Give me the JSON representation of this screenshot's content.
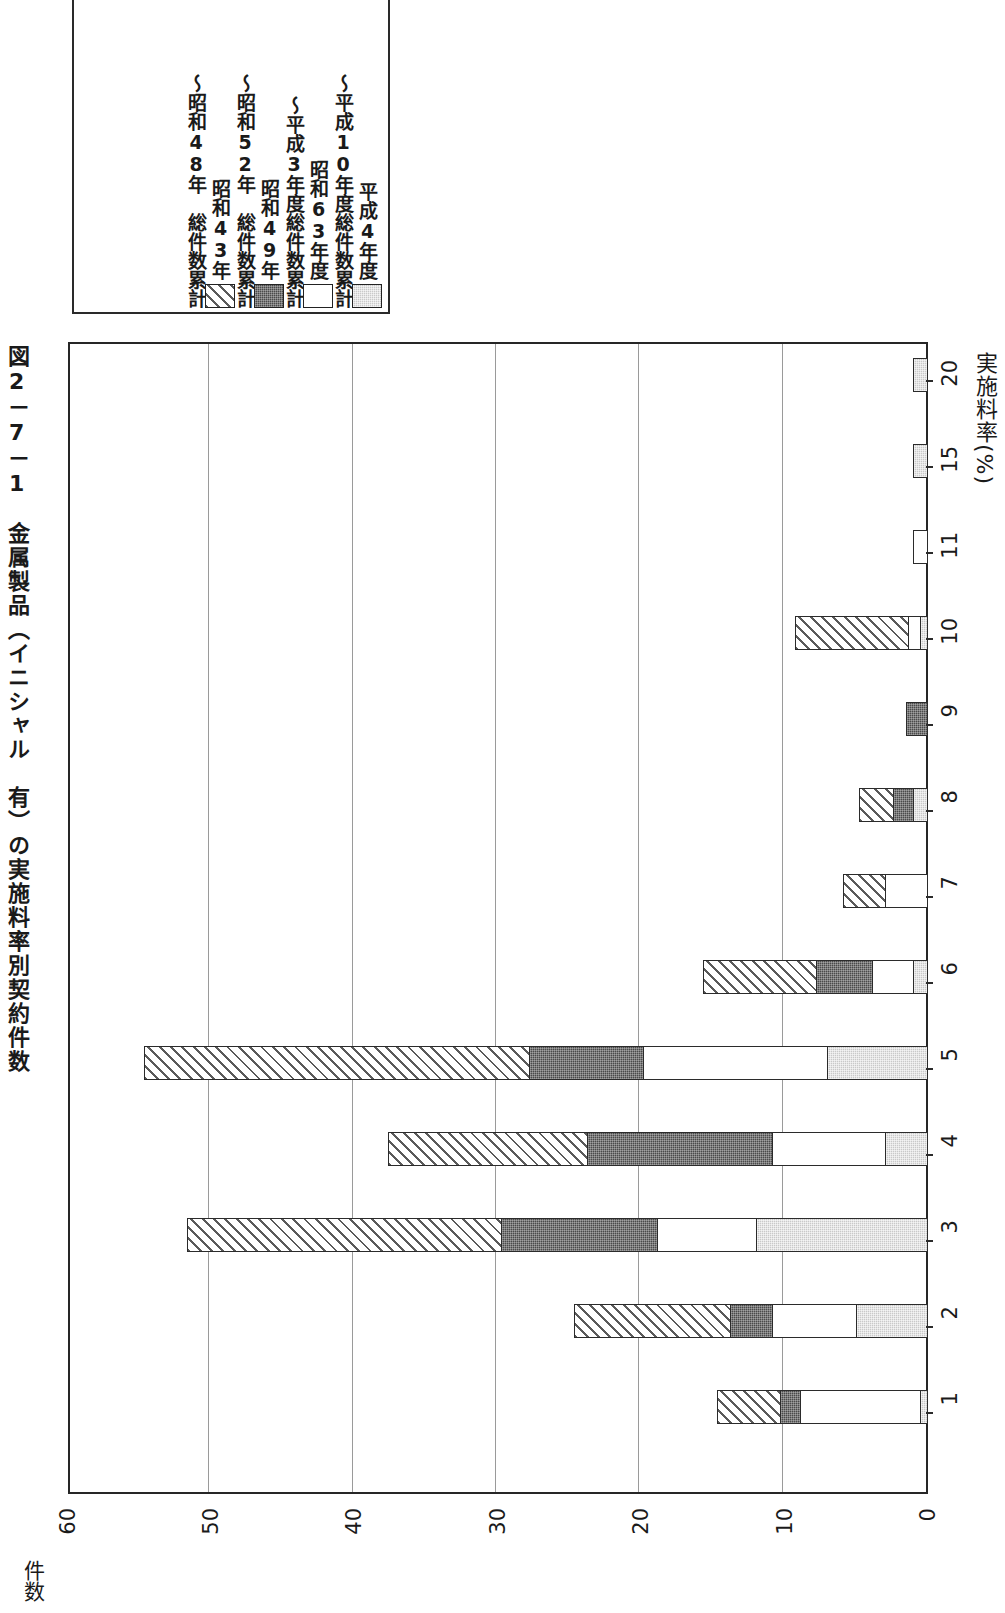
{
  "title": "図2－7－1　金属製品（イニシャル　有）の実施料率別契約件数",
  "legend": {
    "entries": [
      {
        "swatch": "light-gray-stipple",
        "color": "#c9c9c9",
        "label": "平成4年度",
        "cont": "～平成10年度総件数累計"
      },
      {
        "swatch": "white",
        "color": "#ffffff",
        "label": "昭和63年度",
        "cont": "～平成3年度総件数累計"
      },
      {
        "swatch": "dark-gray-stipple",
        "color": "#4a4a4a",
        "label": "昭和49年",
        "cont": "～昭和52年　総件数累計"
      },
      {
        "swatch": "diagonal-hatch",
        "color": "#5a5a5a",
        "label": "昭和43年",
        "cont": "～昭和48年　総件数累計"
      }
    ]
  },
  "axes": {
    "value_axis_title": "件数",
    "value_ticks": [
      "0",
      "10",
      "20",
      "30",
      "40",
      "50",
      "60"
    ],
    "category_axis_title_main": "実施料率",
    "category_axis_title_unit": "(%)"
  },
  "chart_data": {
    "type": "bar",
    "orientation": "horizontal-rotated",
    "title": "図2－7－1　金属製品（イニシャル　有）の実施料率別契約件数",
    "xlabel": "実施料率 (%)",
    "ylabel": "件数",
    "ylim": [
      0,
      60
    ],
    "grid": true,
    "stacked": true,
    "legend_position": "top-left",
    "categories": [
      "1",
      "2",
      "3",
      "4",
      "5",
      "6",
      "7",
      "8",
      "9",
      "10",
      "11",
      "15",
      "20"
    ],
    "series": [
      {
        "name": "昭和43年～昭和48年 総件数累計",
        "fill": "diagonal-hatch",
        "values": [
          4.5,
          11,
          22,
          14,
          27,
          8,
          3,
          2.5,
          0,
          8,
          0,
          0,
          0
        ]
      },
      {
        "name": "昭和49年～昭和52年 総件数累計",
        "fill": "dark-gray-stipple",
        "values": [
          1.5,
          3,
          11,
          13,
          8,
          4,
          0,
          1.5,
          1.5,
          0,
          0,
          0,
          0
        ]
      },
      {
        "name": "昭和63年度～平成3年度総件数累計",
        "fill": "white",
        "values": [
          8.5,
          6,
          7,
          8,
          13,
          3,
          3,
          0,
          0,
          1,
          1,
          0,
          0
        ]
      },
      {
        "name": "平成4年度～平成10年度総件数累計",
        "fill": "light-gray-stipple",
        "values": [
          0.5,
          5,
          12,
          3,
          7,
          1,
          0,
          1,
          0,
          0.5,
          0,
          1,
          1
        ]
      }
    ],
    "totals": [
      15,
      25,
      52,
      38,
      55,
      16,
      6,
      5,
      1.5,
      9.5,
      1,
      1,
      1
    ]
  },
  "render": {
    "plot_px": {
      "left": 68,
      "top": 342,
      "width": 860,
      "height": 1152
    },
    "value_max": 60,
    "category_tick_positions": [
      1410,
      1324,
      1238,
      1152,
      1066,
      980,
      894,
      808,
      722,
      636,
      550,
      464,
      378
    ],
    "bar_rows": [
      {
        "cat": "1",
        "top": 1388,
        "segs": [
          {
            "fill": "fill-gray",
            "len": 0.5
          },
          {
            "fill": "fill-white",
            "len": 8.5
          },
          {
            "fill": "fill-dark",
            "len": 1.5
          },
          {
            "fill": "fill-hatch",
            "len": 4.5
          }
        ]
      },
      {
        "cat": "2",
        "top": 1302,
        "segs": [
          {
            "fill": "fill-gray",
            "len": 5
          },
          {
            "fill": "fill-white",
            "len": 6
          },
          {
            "fill": "fill-dark",
            "len": 3
          },
          {
            "fill": "fill-hatch",
            "len": 11
          }
        ]
      },
      {
        "cat": "3",
        "top": 1216,
        "segs": [
          {
            "fill": "fill-gray",
            "len": 12
          },
          {
            "fill": "fill-white",
            "len": 7
          },
          {
            "fill": "fill-dark",
            "len": 11
          },
          {
            "fill": "fill-hatch",
            "len": 22
          }
        ]
      },
      {
        "cat": "4",
        "top": 1130,
        "segs": [
          {
            "fill": "fill-gray",
            "len": 3
          },
          {
            "fill": "fill-white",
            "len": 8
          },
          {
            "fill": "fill-dark",
            "len": 13
          },
          {
            "fill": "fill-hatch",
            "len": 14
          }
        ]
      },
      {
        "cat": "5",
        "top": 1044,
        "segs": [
          {
            "fill": "fill-gray",
            "len": 7
          },
          {
            "fill": "fill-white",
            "len": 13
          },
          {
            "fill": "fill-dark",
            "len": 8
          },
          {
            "fill": "fill-hatch",
            "len": 27
          }
        ]
      },
      {
        "cat": "6",
        "top": 958,
        "segs": [
          {
            "fill": "fill-gray",
            "len": 1
          },
          {
            "fill": "fill-white",
            "len": 3
          },
          {
            "fill": "fill-dark",
            "len": 4
          },
          {
            "fill": "fill-hatch",
            "len": 8
          }
        ]
      },
      {
        "cat": "7",
        "top": 872,
        "segs": [
          {
            "fill": "fill-white",
            "len": 3
          },
          {
            "fill": "fill-hatch",
            "len": 3
          }
        ]
      },
      {
        "cat": "8",
        "top": 786,
        "segs": [
          {
            "fill": "fill-gray",
            "len": 1
          },
          {
            "fill": "fill-dark",
            "len": 1.5
          },
          {
            "fill": "fill-hatch",
            "len": 2.5
          }
        ]
      },
      {
        "cat": "9",
        "top": 700,
        "segs": [
          {
            "fill": "fill-dark",
            "len": 1.5
          }
        ]
      },
      {
        "cat": "10",
        "top": 614,
        "segs": [
          {
            "fill": "fill-gray",
            "len": 0.5
          },
          {
            "fill": "fill-white",
            "len": 1
          },
          {
            "fill": "fill-hatch",
            "len": 8
          }
        ]
      },
      {
        "cat": "11",
        "top": 528,
        "segs": [
          {
            "fill": "fill-white",
            "len": 1
          }
        ]
      },
      {
        "cat": "15",
        "top": 442,
        "segs": [
          {
            "fill": "fill-gray",
            "len": 1
          }
        ]
      },
      {
        "cat": "20",
        "top": 356,
        "segs": [
          {
            "fill": "fill-gray",
            "len": 1
          }
        ]
      }
    ],
    "value_tick_px": [
      928,
      785,
      641,
      498,
      354,
      211,
      68
    ]
  }
}
